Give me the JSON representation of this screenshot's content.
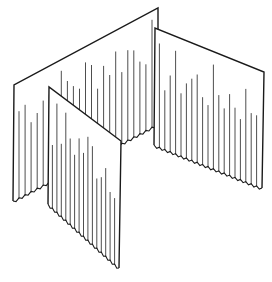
{
  "figure": {
    "title": "Curtain room-divider panels (line drawing)",
    "background": "#ffffff",
    "ink": "#1a1a1a"
  },
  "panels": [
    {
      "id": "back-left",
      "top": [
        [
          14,
          85
        ],
        [
          158,
          8
        ]
      ],
      "bottom": [
        [
          13,
          201
        ],
        [
          158,
          124
        ]
      ],
      "pleats": 24,
      "pleat_len": [
        0.55,
        0.95
      ]
    },
    {
      "id": "back-right",
      "top": [
        [
          155,
          28
        ],
        [
          264,
          72
        ]
      ],
      "bottom": [
        [
          154,
          145
        ],
        [
          262,
          188
        ]
      ],
      "pleats": 20,
      "pleat_len": [
        0.45,
        0.9
      ]
    },
    {
      "id": "front",
      "top": [
        [
          49,
          87
        ],
        [
          121,
          141
        ]
      ],
      "bottom": [
        [
          48,
          204
        ],
        [
          119,
          268
        ]
      ],
      "pleats": 16,
      "pleat_len": [
        0.5,
        0.95
      ]
    }
  ]
}
